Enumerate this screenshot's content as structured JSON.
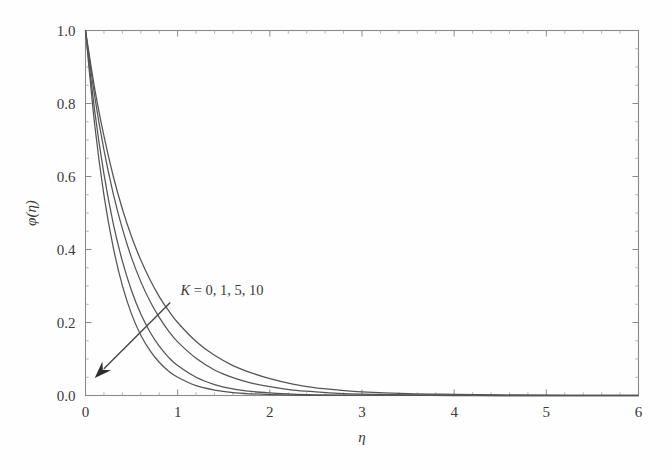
{
  "figure": {
    "background_color": "#fefefe",
    "frame_color": "#8a8a8a",
    "curve_color": "#555555"
  },
  "chart_data": {
    "type": "line",
    "title": "",
    "subtitle": "",
    "xlabel": "η",
    "ylabel": "φ(η)",
    "xlim": [
      0,
      6
    ],
    "ylim": [
      0,
      1.0
    ],
    "xticks": [
      0,
      1,
      2,
      3,
      4,
      5,
      6
    ],
    "xticklabels": [
      "0",
      "1",
      "2",
      "3",
      "4",
      "5",
      "6"
    ],
    "yticks": [
      0.0,
      0.2,
      0.4,
      0.6,
      0.8,
      1.0
    ],
    "yticklabels": [
      "0.0",
      "0.2",
      "0.4",
      "0.6",
      "0.8",
      "1.0"
    ],
    "minor_ticks_per_major_x": 5,
    "minor_ticks_per_major_y": 4,
    "grid": false,
    "legend": null,
    "legend_position": "none",
    "frame": "box-all-sides",
    "annotations": [
      {
        "name": "parameter-annotation",
        "text_parts": {
          "symbol": "K",
          "equals": " = ",
          "values": "0, 1, 5, 10"
        },
        "text": "K = 0, 1, 5, 10",
        "x": 1.03,
        "y": 0.275
      },
      {
        "name": "direction-arrow",
        "from": [
          0.92,
          0.255
        ],
        "to": [
          0.1,
          0.048
        ],
        "meaning": "increasing K"
      }
    ],
    "series": [
      {
        "name": "K = 0",
        "K": 0,
        "x": [
          0.0,
          0.1,
          0.2,
          0.3,
          0.4,
          0.5,
          0.6,
          0.7,
          0.8,
          0.9,
          1.0,
          1.2,
          1.4,
          1.6,
          1.8,
          2.0,
          2.25,
          2.5,
          2.75,
          3.0,
          3.5,
          4.0,
          4.5,
          5.0,
          5.5,
          6.0
        ],
        "y": [
          1.0,
          0.841,
          0.711,
          0.602,
          0.511,
          0.435,
          0.371,
          0.317,
          0.271,
          0.233,
          0.2,
          0.148,
          0.11,
          0.082,
          0.062,
          0.046,
          0.031,
          0.021,
          0.015,
          0.01,
          0.005,
          0.003,
          0.0015,
          0.0008,
          0.0005,
          0.0003
        ]
      },
      {
        "name": "K = 1",
        "K": 1,
        "x": [
          0.0,
          0.1,
          0.2,
          0.3,
          0.4,
          0.5,
          0.6,
          0.7,
          0.8,
          0.9,
          1.0,
          1.2,
          1.4,
          1.6,
          1.8,
          2.0,
          2.25,
          2.5,
          2.75,
          3.0,
          3.5,
          4.0,
          4.5,
          5.0,
          5.5,
          6.0
        ],
        "y": [
          1.0,
          0.819,
          0.673,
          0.554,
          0.457,
          0.377,
          0.312,
          0.258,
          0.214,
          0.177,
          0.147,
          0.102,
          0.07,
          0.049,
          0.034,
          0.024,
          0.015,
          0.01,
          0.006,
          0.004,
          0.0018,
          0.0008,
          0.0004,
          0.0002,
          0.0001,
          5e-05
        ]
      },
      {
        "name": "K = 5",
        "K": 5,
        "x": [
          0.0,
          0.1,
          0.2,
          0.3,
          0.4,
          0.5,
          0.6,
          0.7,
          0.8,
          0.9,
          1.0,
          1.2,
          1.4,
          1.6,
          1.8,
          2.0,
          2.25,
          2.5,
          2.75,
          3.0,
          3.5,
          4.0,
          4.5,
          5.0,
          5.5,
          6.0
        ],
        "y": [
          1.0,
          0.779,
          0.607,
          0.472,
          0.368,
          0.287,
          0.223,
          0.174,
          0.135,
          0.105,
          0.082,
          0.05,
          0.03,
          0.018,
          0.011,
          0.007,
          0.0035,
          0.0018,
          0.0009,
          0.0005,
          0.0001,
          3e-05,
          1e-05,
          3e-06,
          1e-06,
          3e-07
        ]
      },
      {
        "name": "K = 10",
        "K": 10,
        "x": [
          0.0,
          0.1,
          0.2,
          0.3,
          0.4,
          0.5,
          0.6,
          0.7,
          0.8,
          0.9,
          1.0,
          1.2,
          1.4,
          1.6,
          1.8,
          2.0,
          2.25,
          2.5,
          2.75,
          3.0,
          3.5,
          4.0,
          4.5,
          5.0,
          5.5,
          6.0
        ],
        "y": [
          1.0,
          0.741,
          0.549,
          0.407,
          0.301,
          0.223,
          0.165,
          0.123,
          0.091,
          0.067,
          0.05,
          0.027,
          0.015,
          0.008,
          0.0045,
          0.0025,
          0.0011,
          0.0005,
          0.0002,
          0.0001,
          2e-05,
          4e-06,
          8e-07,
          2e-07,
          4e-08,
          1e-08
        ]
      }
    ]
  }
}
